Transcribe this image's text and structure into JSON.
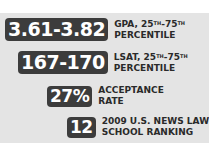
{
  "stats": [
    {
      "value": "3.61-3.82",
      "line1": "GPA, 25",
      "line1_sup1": "TH",
      "line1_mid": "-75",
      "line1_sup2": "TH",
      "line2": "PERCENTILE"
    },
    {
      "value": "167-170",
      "line1": "LSAT, 25",
      "line1_sup1": "TH",
      "line1_mid": "-75",
      "line1_sup2": "TH",
      "line2": "PERCENTILE"
    },
    {
      "value": "27%",
      "line1": "ACCEPTANCE",
      "line2": "RATE"
    },
    {
      "value": "12",
      "line1": "2009 U.S. NEWS LAW",
      "line2": "SCHOOL RANKING"
    }
  ],
  "colors": {
    "panel": "#e4e4e4",
    "badge": "#3c3c3c",
    "badge_text": "#ffffff",
    "caption": "#2a2a2a"
  }
}
